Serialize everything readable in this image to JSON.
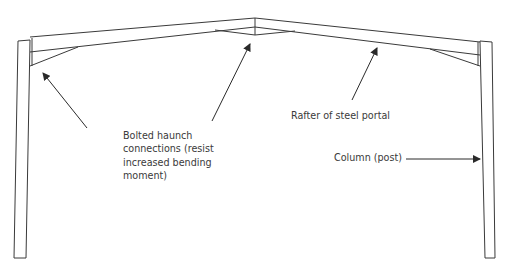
{
  "diagram": {
    "colors": {
      "stroke": "#3a3a3a",
      "text": "#3a3a3a",
      "background": "#ffffff"
    },
    "labels": {
      "haunch": [
        "Bolted haunch",
        "connections (resist",
        "increased bending",
        "moment)"
      ],
      "rafter": "Rafter of steel portal",
      "column": "Column (post)"
    },
    "elements": [
      "left-column",
      "right-column",
      "left-rafter",
      "right-rafter",
      "left-eave-haunch",
      "right-eave-haunch",
      "apex-haunch"
    ],
    "arrows": [
      {
        "name": "haunch-arrow-left",
        "from": [
          87,
          128
        ],
        "to": [
          43,
          73
        ]
      },
      {
        "name": "haunch-arrow-apex",
        "from": [
          212,
          121
        ],
        "to": [
          250,
          44
        ]
      },
      {
        "name": "rafter-arrow",
        "from": [
          352,
          100
        ],
        "to": [
          377,
          48
        ]
      },
      {
        "name": "column-arrow",
        "from": [
          406,
          159
        ],
        "to": [
          480,
          159
        ]
      }
    ]
  }
}
